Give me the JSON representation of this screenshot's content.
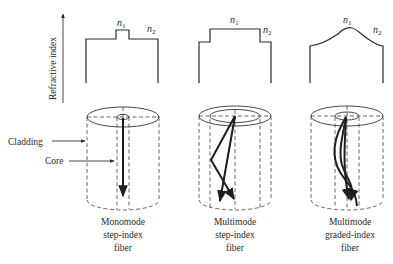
{
  "figure": {
    "y_axis_label": "Refractive index",
    "labels": {
      "cladding": "Cladding",
      "core": "Core"
    },
    "index_symbols": {
      "core": {
        "base": "n",
        "sub": "1"
      },
      "cladding": {
        "base": "n",
        "sub": "2"
      }
    },
    "panels": [
      {
        "id": "monomode-step-index",
        "profile": "step-narrow",
        "caption": [
          "Monomode",
          "step-index",
          "fiber"
        ]
      },
      {
        "id": "multimode-step-index",
        "profile": "step-wide",
        "caption": [
          "Multimode",
          "step-index",
          "fiber"
        ]
      },
      {
        "id": "multimode-graded-index",
        "profile": "graded",
        "caption": [
          "Multimode",
          "graded-index",
          "fiber"
        ]
      }
    ],
    "colors": {
      "ink": "#2a2a2a",
      "background": "#ffffff"
    }
  }
}
